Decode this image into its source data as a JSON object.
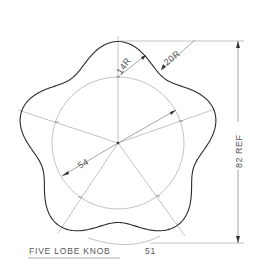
{
  "drawing": {
    "title": "FIVE LOBE KNOB",
    "figure_number": "51",
    "dimensions": {
      "overall_height": "82 REF",
      "inner_circle_diameter": "54",
      "lobe_radius": "14R",
      "valley_radius": "20R"
    },
    "colors": {
      "outline": "#2a2a2a",
      "construction": "#9a9a9a",
      "text": "#555555",
      "background": "#ffffff"
    }
  }
}
